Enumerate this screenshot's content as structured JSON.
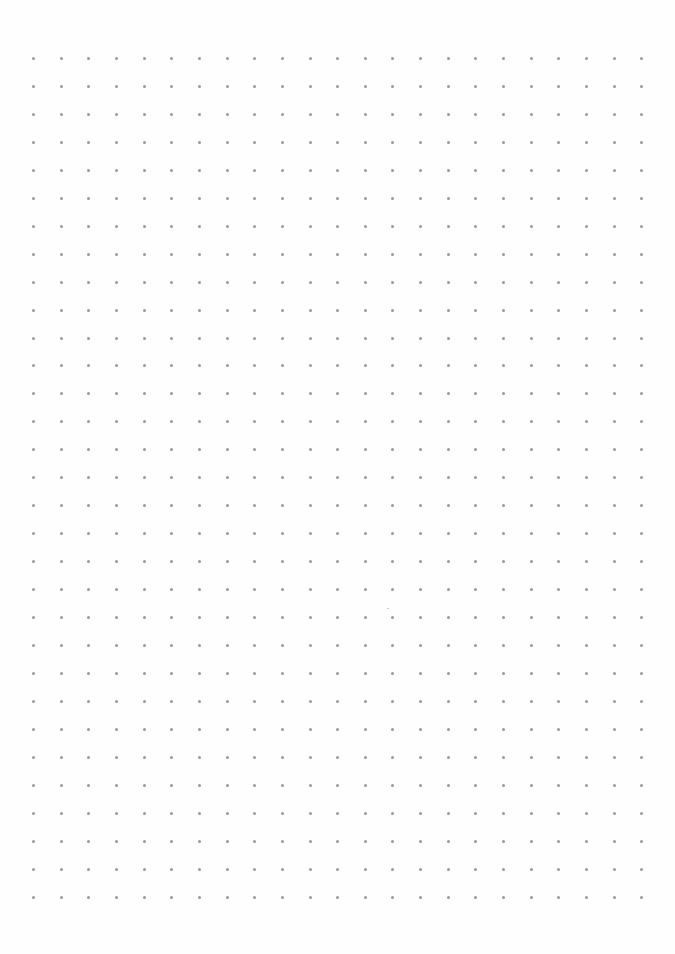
{
  "page": {
    "type": "dot-grid-paper",
    "background_color": "#fefefe"
  },
  "grid": {
    "columns": 23,
    "rows": 31,
    "origin_x": 33.5,
    "origin_y": 58.5,
    "spacing_x": 27.65,
    "spacing_y": 27.95,
    "dot_size": 3,
    "dot_color": "#9a9a9a"
  },
  "speck": {
    "x": 387,
    "y": 608,
    "color": "#cfcfcf"
  }
}
